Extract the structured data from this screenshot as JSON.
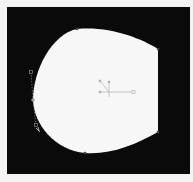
{
  "canvas": {
    "background": "#0a0a0a",
    "frame_color": "#f4f4f4"
  },
  "shape": {
    "fill": "#f7f7f7",
    "anchor_points": [
      {
        "x": 77,
        "y": 29
      },
      {
        "x": 158,
        "y": 49
      },
      {
        "x": 158,
        "y": 132
      },
      {
        "x": 85,
        "y": 153
      },
      {
        "x": 33,
        "y": 100
      }
    ]
  },
  "selection": {
    "handle_color": "#9a9a9a",
    "bezier_handles": [
      {
        "x": 31,
        "y": 72
      },
      {
        "x": 36,
        "y": 125
      }
    ]
  },
  "gizmo": {
    "center": {
      "x": 109,
      "y": 92
    },
    "color": "#b0b0b0",
    "scale_handle": {
      "x": 133,
      "y": 92
    }
  }
}
